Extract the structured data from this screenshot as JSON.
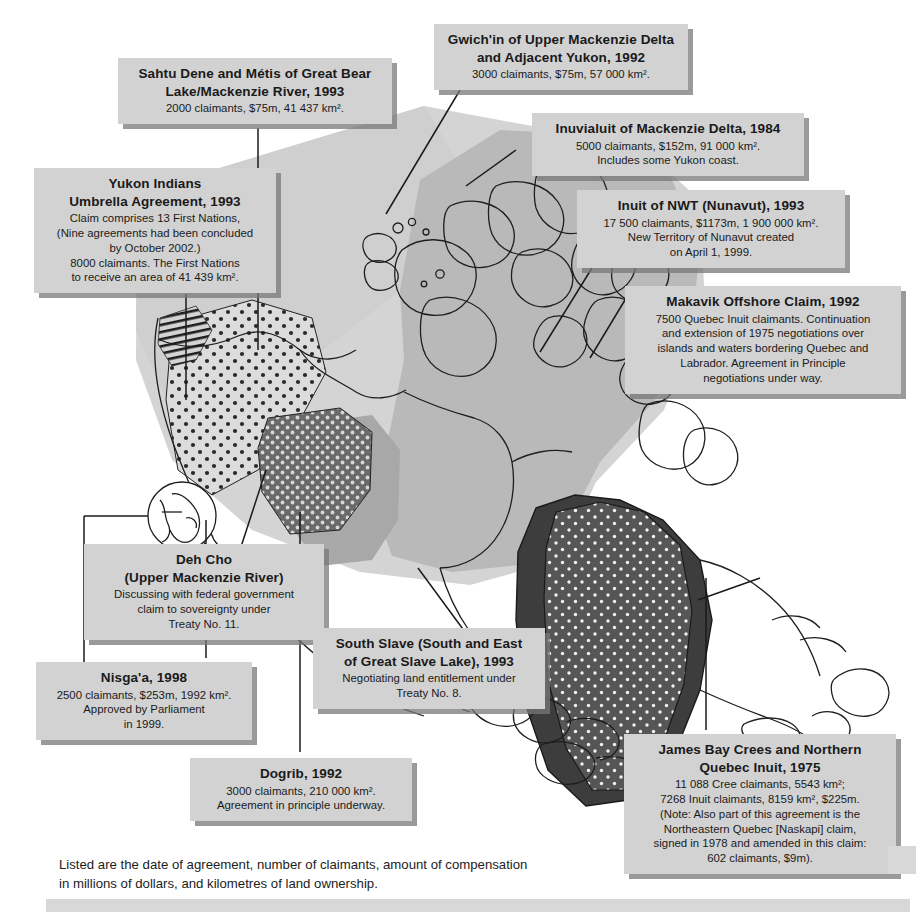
{
  "map": {
    "title": "Comprehensive land claims in Canada",
    "colors": {
      "land_light": "#d0d0d0",
      "land_mid": "#b4b4b4",
      "land_dark": "#9a9a9a",
      "claim_dark": "#555555",
      "claim_darker": "#3a3a3a",
      "outline": "#1a1a1a",
      "box_fill": "#d2d2d2",
      "box_shadow": "#787878",
      "page_bg": "#ffffff"
    },
    "regions": [
      {
        "name": "yukon-indians-hatched",
        "pattern": "diagonal-hatch"
      },
      {
        "name": "sahtu-dene-metis-dotted",
        "pattern": "coarse-dots-light"
      },
      {
        "name": "dogrib-dotted-dark",
        "pattern": "dots-dark"
      },
      {
        "name": "south-slave-solid",
        "pattern": "solid-mid"
      },
      {
        "name": "inuvialuit-light",
        "pattern": "solid-light"
      },
      {
        "name": "nunavut-mid",
        "pattern": "solid-mid"
      },
      {
        "name": "gwichin-light",
        "pattern": "solid-light"
      },
      {
        "name": "makavik-offshore",
        "pattern": "solid-dark"
      },
      {
        "name": "james-bay-cree-dotted",
        "pattern": "dots-on-dark"
      }
    ],
    "inset": {
      "name": "nisgaa-detail-circle"
    }
  },
  "callouts": [
    {
      "id": "gwichin",
      "title_lines": [
        "Gwich'in of Upper Mackenzie Delta",
        "and Adjacent Yukon, 1992"
      ],
      "body_lines": [
        "3000 claimants, $75m, 57 000 km²."
      ]
    },
    {
      "id": "sahtu",
      "title_lines": [
        "Sahtu Dene and Métis of Great Bear",
        "Lake/Mackenzie River, 1993"
      ],
      "body_lines": [
        "2000 claimants, $75m, 41 437 km²."
      ]
    },
    {
      "id": "inuvialuit",
      "title_lines": [
        "Inuvialuit of Mackenzie Delta, 1984"
      ],
      "body_lines": [
        "5000 claimants, $152m, 91 000 km².",
        "Includes some Yukon coast."
      ]
    },
    {
      "id": "nunavut",
      "title_lines": [
        "Inuit of NWT (Nunavut), 1993"
      ],
      "body_lines": [
        "17 500 claimants, $1173m, 1 900 000 km².",
        "New Territory of Nunavut created",
        "on April 1, 1999."
      ]
    },
    {
      "id": "makavik",
      "title_lines": [
        "Makavik Offshore Claim, 1992"
      ],
      "body_lines": [
        "7500 Quebec Inuit claimants. Continuation",
        "and extension of 1975 negotiations over",
        "islands and waters bordering Quebec and",
        "Labrador. Agreement in Principle",
        "negotiations under way."
      ]
    },
    {
      "id": "yukon",
      "title_lines": [
        "Yukon Indians",
        "Umbrella Agreement, 1993"
      ],
      "body_lines": [
        "Claim comprises 13 First Nations,",
        "(Nine agreements had been concluded",
        "by October 2002.)",
        "8000 claimants. The First Nations",
        "to receive an area of 41 439 km²."
      ]
    },
    {
      "id": "dehcho",
      "title_lines": [
        "Deh Cho",
        "(Upper Mackenzie River)"
      ],
      "body_lines": [
        "Discussing with federal government",
        "claim to sovereignty under",
        "Treaty No. 11."
      ]
    },
    {
      "id": "southslave",
      "title_lines": [
        "South Slave (South and East",
        "of Great Slave Lake), 1993"
      ],
      "body_lines": [
        "Negotiating land entitlement under",
        "Treaty No. 8."
      ]
    },
    {
      "id": "nisgaa",
      "title_lines": [
        "Nisga'a, 1998"
      ],
      "body_lines": [
        "2500 claimants, $253m, 1992 km².",
        "Approved by Parliament",
        "in 1999."
      ]
    },
    {
      "id": "dogrib",
      "title_lines": [
        "Dogrib, 1992"
      ],
      "body_lines": [
        "3000 claimants, 210 000 km².",
        "Agreement in principle underway."
      ]
    },
    {
      "id": "jamesbay",
      "title_lines": [
        "James Bay Crees and Northern",
        "Quebec Inuit, 1975"
      ],
      "body_lines": [
        "11 088 Cree claimants, 5543 km²;",
        "7268 Inuit claimants, 8159 km², $225m.",
        "(Note: Also part of this agreement is the",
        "Northeastern Quebec [Naskapi] claim,",
        "signed in 1978 and amended in this claim:",
        "602 claimants, $9m)."
      ]
    }
  ],
  "caption": {
    "line1": "Listed are the date of agreement, number of claimants, amount of compensation",
    "line2": "in millions of dollars, and kilometres of land ownership."
  }
}
